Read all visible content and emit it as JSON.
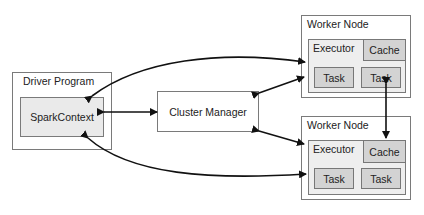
{
  "driver": {
    "title": "Driver Program",
    "context": "SparkContext"
  },
  "cluster_manager": {
    "label": "Cluster Manager"
  },
  "workers": [
    {
      "title": "Worker Node",
      "executor": "Executor",
      "cache": "Cache",
      "tasks": [
        "Task",
        "Task"
      ]
    },
    {
      "title": "Worker Node",
      "executor": "Executor",
      "cache": "Cache",
      "tasks": [
        "Task",
        "Task"
      ]
    }
  ],
  "colors": {
    "outer_fill": "#ffffff",
    "inner_fill": "#eeeeee",
    "cell_fill": "#d3d3d3",
    "border": "#7a7a7a",
    "arrow": "#111111"
  }
}
